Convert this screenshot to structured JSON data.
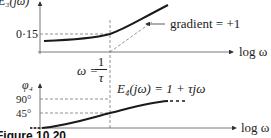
{
  "figure": {
    "caption": "Figure 10.20",
    "top_plot": {
      "y_label": "E₃(jω)",
      "x_label": "log ω",
      "y_tick": "0·15",
      "annotation": "gradient = +1"
    },
    "divider": {
      "omega_label": "ω =",
      "numerator": "1",
      "denominator": "τ"
    },
    "bottom_plot": {
      "y_label": "φ₄",
      "x_label": "log ω",
      "y_ticks": [
        "90°",
        "45°"
      ],
      "equation": "E₄(jω) = 1 + τjω"
    }
  },
  "colors": {
    "curve": "#1a1a1a",
    "axis": "#333333",
    "dashed": "#666666"
  }
}
